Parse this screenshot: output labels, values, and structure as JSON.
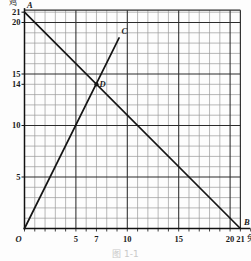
{
  "figure": {
    "caption": "图 1-1",
    "axis": {
      "y_unit_label": "鸡",
      "x_unit_label": "兔",
      "origin_label": "O"
    },
    "y_ticks": [
      {
        "value": 21,
        "label": "21"
      },
      {
        "value": 20,
        "label": "20"
      },
      {
        "value": 15,
        "label": "15"
      },
      {
        "value": 14,
        "label": "14"
      },
      {
        "value": 10,
        "label": "10"
      },
      {
        "value": 5,
        "label": "5"
      }
    ],
    "x_ticks": [
      {
        "value": 5,
        "label": "5"
      },
      {
        "value": 7,
        "label": "7"
      },
      {
        "value": 10,
        "label": "10"
      },
      {
        "value": 15,
        "label": "15"
      },
      {
        "value": 20,
        "label": "20"
      },
      {
        "value": 21,
        "label": "21"
      }
    ],
    "points": [
      {
        "name": "A",
        "label": "A",
        "x": 0,
        "y": 21
      },
      {
        "name": "B",
        "label": "B",
        "x": 21,
        "y": 0
      },
      {
        "name": "C",
        "label": "C",
        "x": 9.2,
        "y": 18.5
      },
      {
        "name": "D",
        "label": "D",
        "x": 7,
        "y": 14
      }
    ],
    "lines": [
      {
        "name": "line-AB",
        "from": "A",
        "to": "B",
        "from_xy": [
          0,
          21
        ],
        "to_xy": [
          21,
          0
        ]
      },
      {
        "name": "line-OC",
        "from": "O",
        "to": "C",
        "from_xy": [
          0,
          0
        ],
        "to_xy": [
          9.2,
          18.5
        ]
      }
    ]
  },
  "chart_data": {
    "type": "line",
    "title": "图 1-1",
    "xlabel": "兔",
    "ylabel": "鸡",
    "xlim": [
      0,
      21
    ],
    "ylim": [
      0,
      22
    ],
    "grid": true,
    "minor_grid_step": 1,
    "major_grid_step": 5,
    "legend": "none",
    "series": [
      {
        "name": "A-B",
        "x": [
          0,
          21
        ],
        "y": [
          21,
          0
        ],
        "annotation": "x + y = 21 (head count line)"
      },
      {
        "name": "O-C",
        "x": [
          0,
          9.2
        ],
        "y": [
          0,
          18.5
        ],
        "annotation": "y = 2x (leg relation line)"
      }
    ],
    "markers": [
      {
        "label": "A",
        "x": 0,
        "y": 21
      },
      {
        "label": "B",
        "x": 21,
        "y": 0
      },
      {
        "label": "C",
        "x": 9.2,
        "y": 18.5
      },
      {
        "label": "D",
        "x": 7,
        "y": 14,
        "filled": true
      }
    ],
    "xticks": [
      0,
      5,
      7,
      10,
      15,
      20,
      21
    ],
    "xticklabels": [
      "O",
      "5",
      "7",
      "10",
      "15",
      "20",
      "21"
    ],
    "yticks": [
      5,
      10,
      14,
      15,
      20,
      21
    ],
    "yticklabels": [
      "5",
      "10",
      "14",
      "15",
      "20",
      "21"
    ]
  },
  "colors": {
    "line": "#151515",
    "grid_minor": "#9a9a9a",
    "grid_major": "#2b2b2b",
    "axis": "#111111",
    "text": "#1a1a1a",
    "caption": "#c9c9c9",
    "background": "#fdfdfd"
  }
}
